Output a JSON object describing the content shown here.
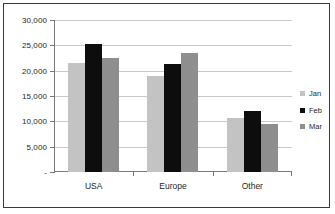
{
  "chart_data": {
    "type": "bar",
    "title": "",
    "xlabel": "",
    "ylabel": "",
    "categories": [
      "USA",
      "Europe",
      "Other"
    ],
    "series": [
      {
        "name": "Jan",
        "color": "#c3c3c3",
        "values": [
          21600,
          19000,
          10600
        ]
      },
      {
        "name": "Feb",
        "color": "#0d0d0d",
        "values": [
          25300,
          21300,
          12100
        ]
      },
      {
        "name": "Mar",
        "color": "#8e8e8e",
        "values": [
          22600,
          23500,
          9400
        ]
      }
    ],
    "ylim": [
      0,
      30000
    ],
    "ytick_values": [
      0,
      5000,
      10000,
      15000,
      20000,
      25000,
      30000
    ],
    "ytick_labels": [
      "-",
      "5,000",
      "10,000",
      "15,000",
      "20,000",
      "25,000",
      "30,000"
    ],
    "grid": true,
    "legend_position": "right"
  },
  "legend": {
    "items": [
      {
        "label": "Jan"
      },
      {
        "label": "Feb"
      },
      {
        "label": "Mar"
      }
    ]
  }
}
